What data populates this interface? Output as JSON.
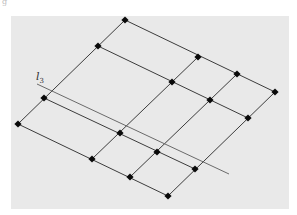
{
  "figure": {
    "background": {
      "x": 11,
      "y": 16,
      "width": 278,
      "height": 193,
      "color": "#e9e9e9"
    },
    "corner_glyph": "g",
    "line_label": {
      "main": "l",
      "sub": "3",
      "x": 36,
      "y": 80
    },
    "reference_line": {
      "x1": 37,
      "y1": 84,
      "x2": 229,
      "y2": 174
    },
    "grid": {
      "rows": [
        [
          [
            125,
            20
          ],
          [
            198,
            57
          ],
          [
            237,
            74
          ],
          [
            275,
            92
          ]
        ],
        [
          [
            98,
            46
          ],
          [
            172,
            82
          ],
          [
            210,
            100
          ],
          [
            248,
            118
          ]
        ],
        [
          [
            44,
            98
          ],
          [
            120,
            133
          ],
          [
            157,
            152
          ],
          [
            195,
            169
          ]
        ],
        [
          [
            18,
            124
          ],
          [
            92,
            159
          ],
          [
            130,
            177
          ],
          [
            168,
            196
          ]
        ]
      ]
    },
    "colors": {
      "line": "#3c3c3c",
      "node": "#0a0a0a",
      "reference": "#6a6a6a"
    }
  }
}
